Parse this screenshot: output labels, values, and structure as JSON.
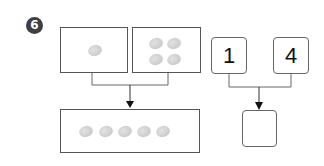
{
  "problem": {
    "number": "6"
  },
  "left_diagram": {
    "top_boxes": [
      {
        "pebble_count": 1
      },
      {
        "pebble_count": 4
      }
    ],
    "result_box": {
      "pebble_count": 5
    }
  },
  "right_diagram": {
    "operands": [
      "1",
      "4"
    ],
    "answer": ""
  },
  "colors": {
    "badge": "#3f3f3f",
    "border": "#555555",
    "pebble": "#cfcfcf"
  }
}
